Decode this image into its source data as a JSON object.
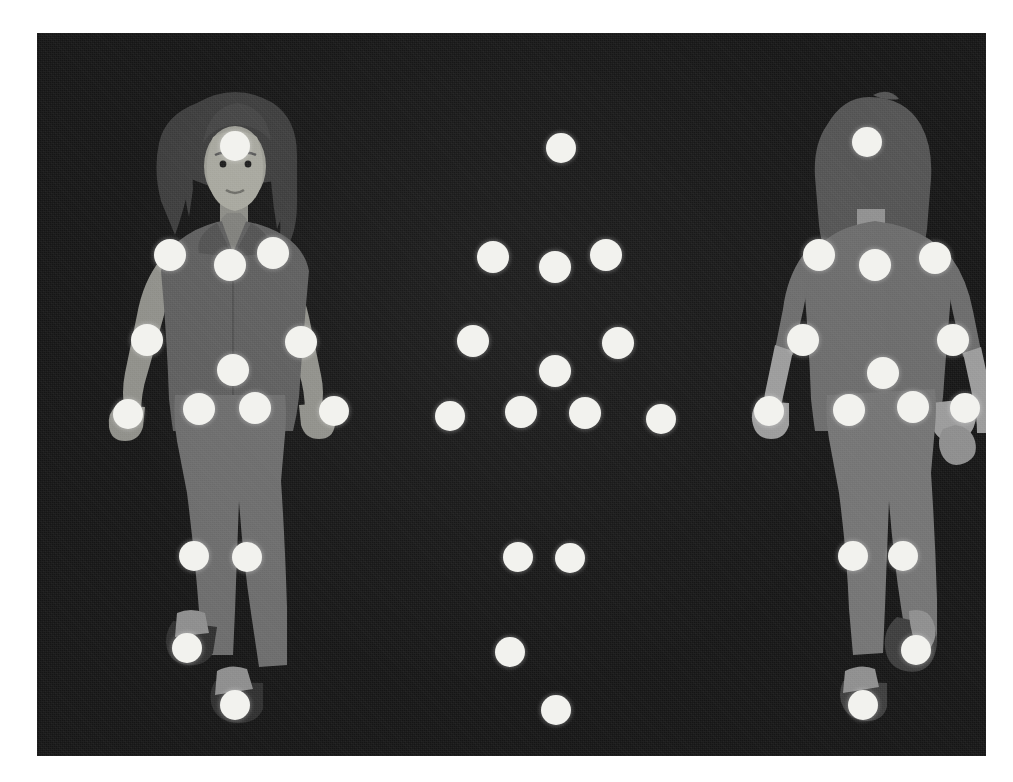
{
  "scene": {
    "title": "Motion capture marker placement reference",
    "background_color": "#151515",
    "page_background_color": "#ffffff",
    "marker_color": "#f2f2ee",
    "canvas": {
      "x": 37,
      "y": 33,
      "width": 949,
      "height": 723
    }
  },
  "figures": [
    {
      "id": "front-figure",
      "label": "Front view figure",
      "view": "front",
      "description": "Illustrated woman facing the viewer, long dark hair, jacket, trousers and shoes",
      "colors": {
        "hair": "#3a3a3a",
        "skin": "#8e8e8e",
        "face_highlight": "#a0a09a",
        "garment_top": "#5c5c5c",
        "garment_bottom": "#6e6e6e",
        "shoe": "#2f2f2f",
        "shoe_highlight": "#8a8a8a"
      }
    },
    {
      "id": "back-figure",
      "label": "Back view figure",
      "view": "back",
      "description": "Silhouetted woman seen from behind, hair down, jacket, trousers and shoes",
      "colors": {
        "hair": "#4e4e4e",
        "skin": "#9a9a9a",
        "garment_top": "#6a6a6a",
        "garment_bottom": "#727272",
        "shoe": "#3a3a3a",
        "shoe_highlight": "#8d8d8d"
      }
    },
    {
      "id": "marker-constellation",
      "label": "Isolated marker constellation",
      "view": "markers-only",
      "description": "The same marker set shown alone against the dark backdrop"
    }
  ],
  "markers": {
    "front_view": [
      {
        "name": "head",
        "x": 198,
        "y": 113,
        "r": 15
      },
      {
        "name": "left-shoulder",
        "x": 133,
        "y": 222,
        "r": 16
      },
      {
        "name": "neck-front",
        "x": 193,
        "y": 232,
        "r": 16
      },
      {
        "name": "right-shoulder",
        "x": 236,
        "y": 220,
        "r": 16
      },
      {
        "name": "left-elbow",
        "x": 110,
        "y": 307,
        "r": 16
      },
      {
        "name": "right-elbow",
        "x": 264,
        "y": 309,
        "r": 16
      },
      {
        "name": "chest-center",
        "x": 196,
        "y": 337,
        "r": 16
      },
      {
        "name": "left-wrist",
        "x": 91,
        "y": 381,
        "r": 15
      },
      {
        "name": "left-hip",
        "x": 162,
        "y": 376,
        "r": 16
      },
      {
        "name": "right-hip",
        "x": 218,
        "y": 375,
        "r": 16
      },
      {
        "name": "right-wrist",
        "x": 297,
        "y": 378,
        "r": 15
      },
      {
        "name": "left-knee",
        "x": 157,
        "y": 523,
        "r": 15
      },
      {
        "name": "right-knee",
        "x": 210,
        "y": 524,
        "r": 15
      },
      {
        "name": "left-ankle",
        "x": 150,
        "y": 615,
        "r": 15
      },
      {
        "name": "right-ankle",
        "x": 198,
        "y": 672,
        "r": 15
      }
    ],
    "back_view": [
      {
        "name": "head",
        "x": 830,
        "y": 109,
        "r": 15
      },
      {
        "name": "left-shoulder",
        "x": 782,
        "y": 222,
        "r": 16
      },
      {
        "name": "spine-upper",
        "x": 838,
        "y": 232,
        "r": 16
      },
      {
        "name": "right-shoulder",
        "x": 898,
        "y": 225,
        "r": 16
      },
      {
        "name": "left-elbow",
        "x": 766,
        "y": 307,
        "r": 16
      },
      {
        "name": "right-elbow",
        "x": 916,
        "y": 307,
        "r": 16
      },
      {
        "name": "spine-lower",
        "x": 846,
        "y": 340,
        "r": 16
      },
      {
        "name": "left-wrist",
        "x": 732,
        "y": 378,
        "r": 15
      },
      {
        "name": "left-hip",
        "x": 812,
        "y": 377,
        "r": 16
      },
      {
        "name": "right-hip",
        "x": 876,
        "y": 374,
        "r": 16
      },
      {
        "name": "right-wrist",
        "x": 928,
        "y": 375,
        "r": 15
      },
      {
        "name": "left-knee",
        "x": 816,
        "y": 523,
        "r": 15
      },
      {
        "name": "right-knee",
        "x": 866,
        "y": 523,
        "r": 15
      },
      {
        "name": "right-ankle",
        "x": 879,
        "y": 617,
        "r": 15
      },
      {
        "name": "left-ankle",
        "x": 826,
        "y": 672,
        "r": 15
      }
    ],
    "constellation": [
      {
        "name": "head",
        "x": 524,
        "y": 115,
        "r": 15
      },
      {
        "name": "left-shoulder",
        "x": 456,
        "y": 224,
        "r": 16
      },
      {
        "name": "neck",
        "x": 518,
        "y": 234,
        "r": 16
      },
      {
        "name": "right-shoulder",
        "x": 569,
        "y": 222,
        "r": 16
      },
      {
        "name": "left-elbow",
        "x": 436,
        "y": 308,
        "r": 16
      },
      {
        "name": "right-elbow",
        "x": 581,
        "y": 310,
        "r": 16
      },
      {
        "name": "torso-center",
        "x": 518,
        "y": 338,
        "r": 16
      },
      {
        "name": "left-wrist",
        "x": 413,
        "y": 383,
        "r": 15
      },
      {
        "name": "left-hip",
        "x": 484,
        "y": 379,
        "r": 16
      },
      {
        "name": "right-hip",
        "x": 548,
        "y": 380,
        "r": 16
      },
      {
        "name": "right-wrist",
        "x": 624,
        "y": 386,
        "r": 15
      },
      {
        "name": "left-knee",
        "x": 481,
        "y": 524,
        "r": 15
      },
      {
        "name": "right-knee",
        "x": 533,
        "y": 525,
        "r": 15
      },
      {
        "name": "left-ankle",
        "x": 473,
        "y": 619,
        "r": 15
      },
      {
        "name": "right-ankle",
        "x": 519,
        "y": 677,
        "r": 15
      }
    ]
  },
  "counts": {
    "markers_per_figure": 15,
    "total_markers": 45
  }
}
